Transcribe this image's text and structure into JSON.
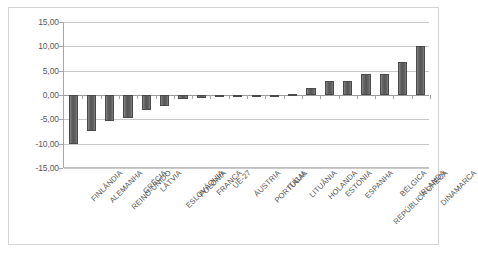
{
  "chart_data": {
    "type": "bar",
    "title": "",
    "subtitle": "",
    "xlabel": "",
    "ylabel": "",
    "ylim": [
      -15.0,
      15.0
    ],
    "ytick_step": 5.0,
    "ytick_labels": [
      "15,00",
      "10,00",
      "5,00",
      "0,00",
      "-5,00",
      "-10,00",
      "-15,00"
    ],
    "ytick_values": [
      15.0,
      10.0,
      5.0,
      0.0,
      -5.0,
      -10.0,
      -15.0
    ],
    "grid": true,
    "legend": false,
    "decimal_separator": ",",
    "bar_color": "#595959",
    "gridline_color": "#c9c9c9",
    "axis_color": "#a6a6a6",
    "categories": [
      "FINLÂNDIA",
      "ALEMANHA",
      "REINO-UNIDO",
      "GRÉCIA",
      "LÁTVIA",
      "ESLOVÁQUIA",
      "POLÓNIA",
      "FRANÇA",
      "UE-27",
      "ÁUSTRIA",
      "PORTUGAL",
      "ITÁLIA",
      "LITUÂNIA",
      "HOLANDA",
      "ESTÓNIA",
      "ESPANHA",
      "REPÚBLICA CHECA",
      "BÉLGICA",
      "IRLANDA",
      "DINAMARCA"
    ],
    "values": [
      -10.0,
      -7.3,
      -5.4,
      -4.7,
      -3.1,
      -2.3,
      -0.8,
      -0.6,
      -0.5,
      -0.4,
      -0.2,
      -0.1,
      0.2,
      1.4,
      2.9,
      2.9,
      4.4,
      4.4,
      6.7,
      10.1
    ]
  }
}
